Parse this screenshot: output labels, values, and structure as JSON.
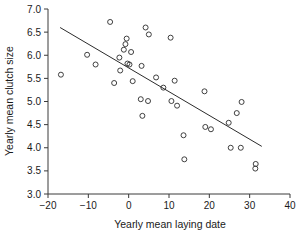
{
  "chart_data": {
    "type": "scatter",
    "title": "",
    "xlabel": "Yearly mean laying date",
    "ylabel": "Yearly mean clutch size",
    "xlim": [
      -20,
      40
    ],
    "ylim": [
      3.0,
      7.0
    ],
    "xticks": [
      -20,
      -10,
      0,
      10,
      20,
      30,
      40
    ],
    "xticklabels": [
      "-20",
      "-10",
      "0",
      "10",
      "20",
      "30",
      "40"
    ],
    "yticks": [
      3.0,
      3.5,
      4.0,
      4.5,
      5.0,
      5.5,
      6.0,
      6.5,
      7.0
    ],
    "yticklabels": [
      "3.0",
      "3.5",
      "4.0",
      "4.5",
      "5.0",
      "5.5",
      "6.0",
      "6.5",
      "7.0"
    ],
    "grid": false,
    "legend": false,
    "marker": "open-circle",
    "marker_color": "#2b2b2b",
    "points": [
      {
        "x": -16.8,
        "y": 5.58
      },
      {
        "x": -10.3,
        "y": 6.01
      },
      {
        "x": -8.2,
        "y": 5.8
      },
      {
        "x": -4.6,
        "y": 6.72
      },
      {
        "x": -3.6,
        "y": 5.4
      },
      {
        "x": -2.3,
        "y": 5.95
      },
      {
        "x": -2.1,
        "y": 5.67
      },
      {
        "x": -1.2,
        "y": 6.12
      },
      {
        "x": -0.8,
        "y": 6.24
      },
      {
        "x": -0.5,
        "y": 6.36
      },
      {
        "x": -0.3,
        "y": 5.82
      },
      {
        "x": 0.2,
        "y": 5.8
      },
      {
        "x": 0.6,
        "y": 6.07
      },
      {
        "x": 1.0,
        "y": 5.44
      },
      {
        "x": 3.0,
        "y": 5.05
      },
      {
        "x": 3.2,
        "y": 5.77
      },
      {
        "x": 3.4,
        "y": 4.69
      },
      {
        "x": 4.2,
        "y": 6.6
      },
      {
        "x": 4.8,
        "y": 5.01
      },
      {
        "x": 5.0,
        "y": 6.45
      },
      {
        "x": 6.8,
        "y": 5.52
      },
      {
        "x": 8.6,
        "y": 5.3
      },
      {
        "x": 10.4,
        "y": 6.38
      },
      {
        "x": 10.6,
        "y": 5.01
      },
      {
        "x": 11.4,
        "y": 5.45
      },
      {
        "x": 12.0,
        "y": 4.91
      },
      {
        "x": 13.6,
        "y": 4.27
      },
      {
        "x": 13.8,
        "y": 3.75
      },
      {
        "x": 18.8,
        "y": 5.22
      },
      {
        "x": 19.0,
        "y": 4.45
      },
      {
        "x": 20.4,
        "y": 4.4
      },
      {
        "x": 24.8,
        "y": 4.54
      },
      {
        "x": 25.3,
        "y": 4.0
      },
      {
        "x": 26.8,
        "y": 4.75
      },
      {
        "x": 27.8,
        "y": 4.0
      },
      {
        "x": 28.0,
        "y": 4.99
      },
      {
        "x": 31.5,
        "y": 3.65
      },
      {
        "x": 31.4,
        "y": 3.55
      }
    ],
    "fit_line": {
      "x0": -17.0,
      "y0": 6.6,
      "x1": 33.0,
      "y1": 4.03,
      "color": "#2b2b2b"
    }
  }
}
